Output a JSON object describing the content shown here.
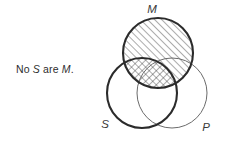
{
  "diagram": {
    "type": "venn-three-circle-syllogism",
    "caption": {
      "full_text": "No S are M.",
      "prefix": "No ",
      "subject_term": "S",
      "middle_word": " are ",
      "predicate_term": "M",
      "suffix": "."
    },
    "labels": {
      "minor_term": "S",
      "middle_term": "M",
      "major_term": "P"
    },
    "circles": [
      {
        "name": "S",
        "label": "S",
        "cx": 142,
        "cy": 93,
        "r": 35,
        "stroke": "#2b2b2b",
        "stroke_width": 2.1,
        "label_x": 105,
        "label_y": 128
      },
      {
        "name": "M",
        "label": "M",
        "cx": 158,
        "cy": 53,
        "r": 35,
        "stroke": "#2b2b2b",
        "stroke_width": 2.1,
        "label_x": 152,
        "label_y": 13
      },
      {
        "name": "P",
        "label": "P",
        "cx": 172,
        "cy": 93,
        "r": 35,
        "stroke": "#6b6b6b",
        "stroke_width": 1.0,
        "label_x": 205,
        "label_y": 131
      }
    ],
    "shading": [
      {
        "region": "M-only-and-M-and-P",
        "description": "M circle shaded with single diagonal hatching",
        "pattern": "diagonal-hatch",
        "hatch_color": "#3a3a3a"
      },
      {
        "region": "S-and-M",
        "description": "Overlap of S and M shaded with cross hatching",
        "pattern": "cross-hatch",
        "hatch_color": "#3a3a3a"
      }
    ],
    "colors": {
      "background": "#ffffff",
      "stroke_dark": "#2b2b2b",
      "stroke_light": "#6b6b6b",
      "text": "#2e2e2e"
    }
  }
}
